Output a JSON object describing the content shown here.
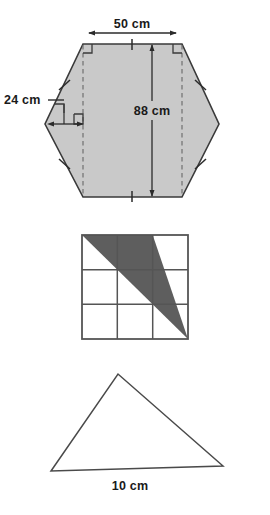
{
  "page": {
    "background_color": "#ffffff",
    "width": 270,
    "height": 515
  },
  "colors": {
    "outline": "#3a3a3a",
    "hexagon_fill": "#c9c9c9",
    "grid_line": "#555555",
    "grid_shaded_fill": "#5e5e5e",
    "triangle_outline": "#4a4a4a",
    "dimension_line": "#2b2b2b",
    "dashed_line": "#707070",
    "label_text": "#1a1a1a"
  },
  "figures": [
    {
      "id": "hexagon-figure",
      "name": "shaded-hexagon",
      "shape": "hexagon",
      "fill": "#c9c9c9",
      "labels": [
        {
          "id": "width-label",
          "text": "50 cm",
          "meaning": "top horizontal dimension",
          "value": 50,
          "unit": "cm"
        },
        {
          "id": "height-label",
          "text": "88 cm",
          "meaning": "vertical dimension between top and bottom edges",
          "value": 88,
          "unit": "cm"
        },
        {
          "id": "leg-label",
          "text": "24 cm",
          "meaning": "horizontal leg of left triangle",
          "value": 24,
          "unit": "cm"
        }
      ],
      "annotations": {
        "right_angle_marks": 4,
        "tick_marks": 6,
        "dashed_vertical_lines": 2
      }
    },
    {
      "id": "grid-figure",
      "name": "shaded-triangle-on-grid",
      "shape": "square-grid-with-shaded-triangle",
      "grid": {
        "rows": 3,
        "columns": 3
      },
      "shaded_triangle_vertices": [
        {
          "col": 0,
          "row": 0
        },
        {
          "col": 2,
          "row": 0
        },
        {
          "col": 3,
          "row": 3
        }
      ],
      "grid_fill": "#ffffff",
      "shaded_fill": "#5e5e5e",
      "labels": []
    },
    {
      "id": "triangle-figure",
      "name": "scalene-triangle",
      "shape": "triangle",
      "fill": "none",
      "labels": [
        {
          "id": "base-label",
          "text": "10 cm",
          "meaning": "base length",
          "value": 10,
          "unit": "cm"
        }
      ]
    }
  ],
  "hexagon": {
    "width_label": "50 cm",
    "height_label": "88 cm",
    "leg_label": "24 cm"
  },
  "triangle": {
    "base_label": "10 cm"
  }
}
